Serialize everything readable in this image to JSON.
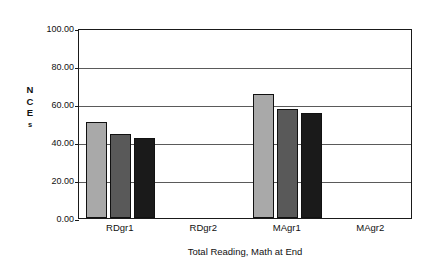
{
  "chart_data": {
    "type": "bar",
    "title": "",
    "xlabel": "Total Reading, Math at End",
    "ylabel": "NCEs",
    "ylabel_chars": [
      "N",
      "C",
      "E",
      "s"
    ],
    "categories": [
      "RDgr1",
      "RDgr2",
      "MAgr1",
      "MAgr2"
    ],
    "series": [
      {
        "name": "series-1",
        "color": "#a9a9a9",
        "values": [
          50.5,
          null,
          65.5,
          null
        ]
      },
      {
        "name": "series-2",
        "color": "#595959",
        "values": [
          44.0,
          null,
          57.5,
          null
        ]
      },
      {
        "name": "series-3",
        "color": "#1a1a1a",
        "values": [
          42.0,
          null,
          55.5,
          null
        ]
      }
    ],
    "ylim": [
      0,
      100
    ],
    "ytick_values": [
      100,
      80,
      60,
      40,
      20,
      0
    ],
    "ytick_labels": [
      "100.00",
      "80.00",
      "60.00",
      "40.00",
      "20.00",
      "0.00"
    ],
    "grid": true,
    "legend": "none",
    "axis_color": "#1a1a1a",
    "gridline_color": "#5a5a5a",
    "background_color": "#ffffff"
  }
}
